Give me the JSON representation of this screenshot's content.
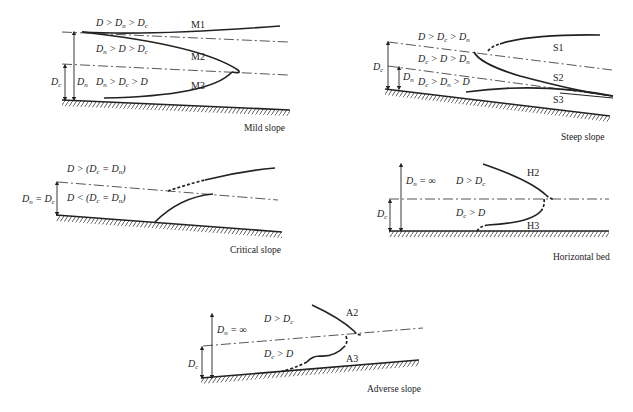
{
  "figure": {
    "panels": [
      {
        "id": "mild",
        "caption": "Mild slope",
        "regions": [
          "D > Dn > Dc",
          "Dn > D > Dc",
          "Dn > Dc > D"
        ],
        "curves": [
          "M1",
          "M2",
          "M3"
        ],
        "dims": [
          "Dc",
          "Dn"
        ]
      },
      {
        "id": "steep",
        "caption": "Steep slope",
        "regions": [
          "D > Dc > Dn",
          "Dc > D > Dn",
          "Dc > Dn > D"
        ],
        "curves": [
          "S1",
          "S2",
          "S3"
        ],
        "dims": [
          "Dc",
          "Dn"
        ]
      },
      {
        "id": "critical",
        "caption": "Critical slope",
        "regions": [
          "D > (Dc = Dn)",
          "D < (Dc = Dn)"
        ],
        "curves": [],
        "dims": [
          "Dn = Dc"
        ]
      },
      {
        "id": "horizontal",
        "caption": "Horizontal bed",
        "regions": [
          "D > Dc",
          "Dc > D"
        ],
        "curves": [
          "H2",
          "H3"
        ],
        "dims": [
          "Dn = ∞",
          "Dc"
        ]
      },
      {
        "id": "adverse",
        "caption": "Adverse slope",
        "regions": [
          "D > Dc",
          "Dc > D"
        ],
        "curves": [
          "A2",
          "A3"
        ],
        "dims": [
          "Dn = ∞",
          "Dc"
        ]
      }
    ]
  }
}
